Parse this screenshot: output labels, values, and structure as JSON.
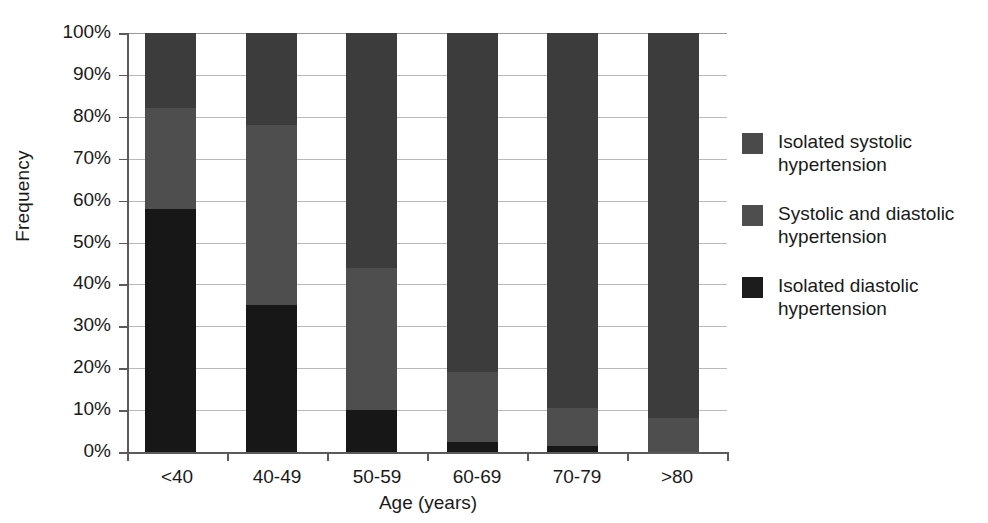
{
  "chart_data": {
    "type": "bar",
    "variant": "stacked-100-percent",
    "title": "",
    "xlabel": "Age (years)",
    "ylabel": "Frequency",
    "categories": [
      "<40",
      "40-49",
      "50-59",
      "60-69",
      "70-79",
      ">80"
    ],
    "ylim": [
      0,
      100
    ],
    "ytick_labels": [
      "0%",
      "10%",
      "20%",
      "30%",
      "40%",
      "50%",
      "60%",
      "70%",
      "80%",
      "90%",
      "100%"
    ],
    "ytick_values": [
      0,
      10,
      20,
      30,
      40,
      50,
      60,
      70,
      80,
      90,
      100
    ],
    "grid": true,
    "grid_axis": "y",
    "legend_position": "right",
    "stack_order_bottom_to_top": [
      "Isolated diastolic hypertension",
      "Systolic and diastolic hypertension",
      "Isolated systolic hypertension"
    ],
    "series": [
      {
        "name": "Isolated systolic hypertension",
        "color": "#3c3c3c",
        "values": [
          18,
          22,
          56,
          81,
          89.5,
          92
        ]
      },
      {
        "name": "Systolic and diastolic hypertension",
        "color": "#4e4e4e",
        "values": [
          24,
          43,
          34,
          16.5,
          9,
          8
        ]
      },
      {
        "name": "Isolated diastolic hypertension",
        "color": "#171717",
        "values": [
          58,
          35,
          10,
          2.5,
          1.5,
          0
        ]
      }
    ]
  },
  "axes": {
    "y_title": "Frequency",
    "x_title": "Age (years)",
    "y_ticks": [
      {
        "label": "0%",
        "value": 0
      },
      {
        "label": "10%",
        "value": 10
      },
      {
        "label": "20%",
        "value": 20
      },
      {
        "label": "30%",
        "value": 30
      },
      {
        "label": "40%",
        "value": 40
      },
      {
        "label": "50%",
        "value": 50
      },
      {
        "label": "60%",
        "value": 60
      },
      {
        "label": "70%",
        "value": 70
      },
      {
        "label": "80%",
        "value": 80
      },
      {
        "label": "90%",
        "value": 90
      },
      {
        "label": "100%",
        "value": 100
      }
    ],
    "x_ticks": [
      {
        "label": "<40"
      },
      {
        "label": "40-49"
      },
      {
        "label": "50-59"
      },
      {
        "label": "60-69"
      },
      {
        "label": "70-79"
      },
      {
        "label": ">80"
      }
    ]
  },
  "legend": {
    "items": [
      {
        "label": "Isolated systolic hypertension",
        "line1": "Isolated systolic",
        "line2": "hypertension",
        "color": "#4a4a4a"
      },
      {
        "label": "Systolic and diastolic hypertension",
        "line1": "Systolic and diastolic",
        "line2": "hypertension",
        "color": "#4e4e4e"
      },
      {
        "label": "Isolated diastolic hypertension",
        "line1": "Isolated diastolic",
        "line2": "hypertension",
        "color": "#1c1c1c"
      }
    ]
  },
  "colors": {
    "background": "#ffffff",
    "axis": "#5a5a5a",
    "gridline": "#b9b9b9",
    "text": "#1a1a1a",
    "isolated_systolic": "#3c3c3c",
    "systolic_and_diastolic": "#4e4e4e",
    "isolated_diastolic": "#171717"
  }
}
